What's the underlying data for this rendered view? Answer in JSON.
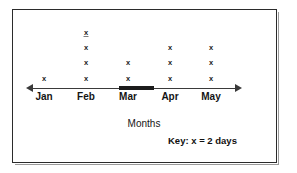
{
  "chart_data": {
    "type": "bar",
    "variant": "pictograph-dot-plot",
    "title": "",
    "subtitle": "",
    "xlabel": "Months",
    "ylabel": "",
    "grid": false,
    "legend_position": "bottom-right",
    "categories": [
      "Jan",
      "Feb",
      "Mar",
      "Apr",
      "May"
    ],
    "values": [
      1,
      4,
      2,
      3,
      3
    ],
    "unit_label": "Key: x = 2 days",
    "unit_symbol": "x",
    "unit_value": 2,
    "unit_name": "days",
    "values_in_days": [
      2,
      8,
      4,
      6,
      6
    ],
    "series": [
      {
        "name": "Rainy days",
        "symbol": "x",
        "values": [
          1,
          4,
          2,
          3,
          3
        ]
      }
    ],
    "axis": {
      "orientation": "horizontal",
      "arrow_start": true,
      "arrow_end": true,
      "highlighted_segment": "Mar"
    },
    "marks": [
      {
        "category": "Jan",
        "count": 1,
        "symbol": "x"
      },
      {
        "category": "Feb",
        "count": 4,
        "symbol": "x"
      },
      {
        "category": "Mar",
        "count": 2,
        "symbol": "x"
      },
      {
        "category": "Apr",
        "count": 3,
        "symbol": "x"
      },
      {
        "category": "May",
        "count": 3,
        "symbol": "x"
      }
    ],
    "colors": {
      "mark": "#1a1a1a",
      "axis": "#3a3a3a",
      "border": "#2b2b2b",
      "background": "#ffffff",
      "text": "#141414"
    }
  },
  "figure": {
    "axis_title": "Months",
    "key_text": "Key: x = 2 days",
    "month_labels": [
      "Jan",
      "Feb",
      "Mar",
      "Apr",
      "May"
    ],
    "mark_symbol": "x"
  }
}
